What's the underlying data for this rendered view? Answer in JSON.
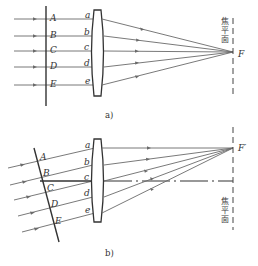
{
  "figure_a": {
    "caption": "a)",
    "wavefront_points": [
      "A",
      "B",
      "C",
      "D",
      "E"
    ],
    "lens_points": [
      "a",
      "b",
      "c",
      "d",
      "e"
    ],
    "focal_plane_label": [
      "焦",
      "平",
      "面"
    ],
    "focus_label": "F"
  },
  "figure_b": {
    "caption": "b)",
    "wavefront_points": [
      "A",
      "B",
      "C",
      "D",
      "E"
    ],
    "lens_points": [
      "a",
      "b",
      "c",
      "d",
      "e"
    ],
    "focal_plane_label": [
      "焦",
      "平",
      "面"
    ],
    "focus_label": "F′"
  },
  "colors": {
    "line": "#333333",
    "ray": "#6a6a6a",
    "background": "#ffffff"
  }
}
